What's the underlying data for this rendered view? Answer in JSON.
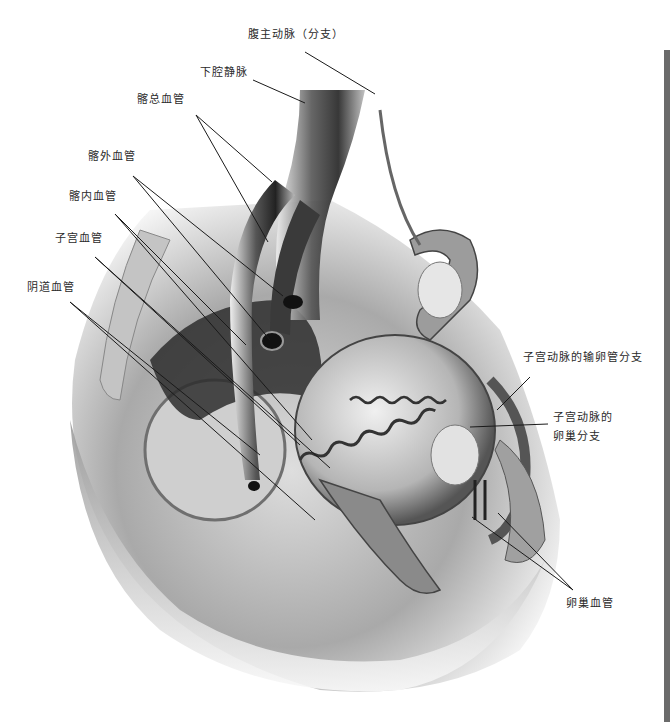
{
  "figure": {
    "type": "anatomical illustration",
    "labels": [
      {
        "id": "abdominal-aorta-branch",
        "text": "腹主动脉（分支）",
        "x": 248,
        "y": 34
      },
      {
        "id": "inferior-vena-cava",
        "text": "下腔静脉",
        "x": 200,
        "y": 72
      },
      {
        "id": "common-iliac-vessels",
        "text": "髂总血管",
        "x": 137,
        "y": 98
      },
      {
        "id": "external-iliac-vessels",
        "text": "髂外血管",
        "x": 88,
        "y": 155
      },
      {
        "id": "internal-iliac-vessels",
        "text": "髂内血管",
        "x": 69,
        "y": 196
      },
      {
        "id": "uterine-vessels",
        "text": "子宫血管",
        "x": 55,
        "y": 238
      },
      {
        "id": "vaginal-vessels",
        "text": "阴道血管",
        "x": 27,
        "y": 287
      },
      {
        "id": "uterine-artery-tubal-branch",
        "text": "子宫动脉的输卵管分支",
        "x": 523,
        "y": 357
      },
      {
        "id": "uterine-artery-ovarian-branch",
        "text": "子宫动脉的\n卵巢分支",
        "line1": "子宫动脉的",
        "line2": "卵巢分支",
        "x": 553,
        "y": 415
      },
      {
        "id": "ovarian-vessels",
        "text": "卵巢血管",
        "x": 566,
        "y": 597
      }
    ]
  },
  "colors": {
    "background": "#ffffff",
    "label_text": "#2a2a2a",
    "leader_line": "#1a1a1a",
    "side_bar": "#6b6b6b"
  }
}
